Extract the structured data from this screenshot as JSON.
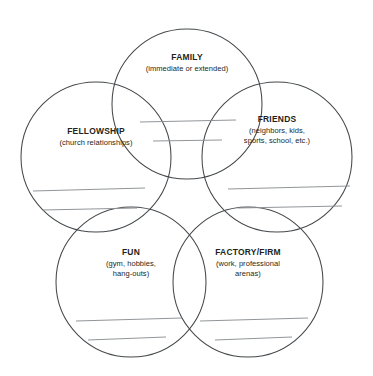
{
  "diagram": {
    "type": "five-circle-venn-worksheet",
    "background_color": "#ffffff",
    "circle_stroke_color": "#44484b",
    "writing_line_color": "#8b8f92",
    "text_color": "#231f20",
    "circles": [
      {
        "id": "family",
        "title": "FAMILY",
        "subtitle_lines": [
          "(immediate or extended)"
        ],
        "center": {
          "x": 187,
          "y": 104
        },
        "radius": 75,
        "label_y": 52,
        "writing_lines": [
          {
            "x1": 140,
            "y1": 122,
            "x2": 236,
            "y2": 120
          },
          {
            "x1": 153,
            "y1": 141,
            "x2": 222,
            "y2": 140
          }
        ]
      },
      {
        "id": "friends",
        "title": "FRIENDS",
        "subtitle_lines": [
          "(neighbors, kids,",
          "sports, school, etc.)"
        ],
        "center": {
          "x": 277,
          "y": 157
        },
        "radius": 75,
        "label_y": 114,
        "writing_lines": [
          {
            "x1": 228,
            "y1": 189,
            "x2": 350,
            "y2": 186
          },
          {
            "x1": 238,
            "y1": 208,
            "x2": 342,
            "y2": 206
          }
        ]
      },
      {
        "id": "fellowship",
        "title": "FELLOWSHIP",
        "subtitle_lines": [
          "(church relationships)"
        ],
        "center": {
          "x": 96,
          "y": 157
        },
        "radius": 75,
        "label_y": 126,
        "writing_lines": [
          {
            "x1": 33,
            "y1": 191,
            "x2": 145,
            "y2": 188
          },
          {
            "x1": 43,
            "y1": 210,
            "x2": 137,
            "y2": 208
          }
        ]
      },
      {
        "id": "fun",
        "title": "FUN",
        "subtitle_lines": [
          "(gym, hobbies,",
          "hang-outs)"
        ],
        "center": {
          "x": 131,
          "y": 282
        },
        "radius": 75,
        "label_y": 247,
        "writing_lines": [
          {
            "x1": 76,
            "y1": 321,
            "x2": 182,
            "y2": 318
          },
          {
            "x1": 88,
            "y1": 340,
            "x2": 166,
            "y2": 337
          }
        ]
      },
      {
        "id": "factory-firm",
        "title": "FACTORY/FIRM",
        "subtitle_lines": [
          "(work, professional",
          "arenas)"
        ],
        "center": {
          "x": 248,
          "y": 282
        },
        "radius": 75,
        "label_y": 247,
        "writing_lines": [
          {
            "x1": 200,
            "y1": 321,
            "x2": 308,
            "y2": 318
          },
          {
            "x1": 215,
            "y1": 340,
            "x2": 292,
            "y2": 337
          }
        ]
      }
    ]
  }
}
